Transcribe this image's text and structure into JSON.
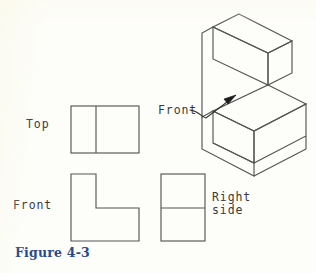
{
  "figure": {
    "caption": "Figure 4-3",
    "caption_color": "#2b4a8b",
    "background_color": "#fdfdfa",
    "line_color": "#555555",
    "text_color": "#3a3a3a"
  },
  "labels": {
    "top_view": "Top",
    "front_view": "Front",
    "right_side_view_line1": "Right",
    "right_side_view_line2": "side",
    "iso_front_face": "Front"
  },
  "views": {
    "top": {
      "name": "Top",
      "shape": "rectangle-with-vertical-divider",
      "rect": {
        "x": 71,
        "y": 106,
        "width": 68,
        "height": 47
      },
      "divider": {
        "type": "vertical",
        "x": 96
      }
    },
    "front": {
      "name": "Front",
      "shape": "L-shape",
      "points": "71,174 96,174 96,208 139,208 139,241 71,241",
      "bbox": {
        "x": 71,
        "y": 174,
        "width": 68,
        "height": 67
      }
    },
    "right_side": {
      "name": "Right side",
      "shape": "rectangle-with-horizontal-divider",
      "rect": {
        "x": 161,
        "y": 174,
        "width": 44,
        "height": 67
      },
      "divider": {
        "type": "horizontal",
        "y": 208
      }
    },
    "isometric": {
      "name": "Isometric pictorial",
      "shape": "L-block-step",
      "outline": "239,14 292,41 292,73 268,85 268,102 306,122 306,154 254,181 202,154 202,41",
      "visible_edges": [
        "239,14 213,27 213,59",
        "213,59 239,72 268,57",
        "239,72 239,104",
        "239,104 254,112",
        "254,112 254,144",
        "254,144 306,117",
        "254,144 202,117",
        "292,41 268,53"
      ]
    }
  },
  "annotation": {
    "leader": {
      "label": "Front",
      "path": "M 190,110 C 198,111 200,116 205,117 L 233,98",
      "arrow_tip": {
        "x": 235,
        "y": 96
      },
      "points_to": "iso-front-face"
    }
  }
}
